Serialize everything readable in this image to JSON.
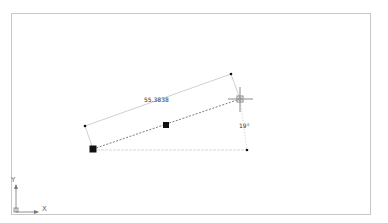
{
  "viewport": {
    "background": "#ffffff",
    "frame_color": "#c8c8c8"
  },
  "drawing": {
    "dimension_label": "55.3838",
    "angle_label": "19°",
    "points": {
      "line_start": [
        93,
        149
      ],
      "line_mid": [
        166,
        125
      ],
      "cursor": [
        240,
        99
      ],
      "dim_ext_left": [
        85,
        126
      ],
      "dim_ext_right": [
        231,
        74
      ],
      "baseline_end": [
        247,
        150
      ]
    },
    "colors": {
      "grip": "#111111",
      "dim_line": "#bdbdbd",
      "rubber_band": "#777777",
      "crosshair": "#888888"
    }
  },
  "ucs": {
    "x_label": "X",
    "y_label": "Y"
  }
}
